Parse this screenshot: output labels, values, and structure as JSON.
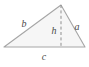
{
  "figure": {
    "kind": "geometry-diagram",
    "shape": "triangle",
    "background_color": "#ffffff",
    "fill_color": "#f6f6f6",
    "edge_color": "#a6a6a6",
    "dashed_color": "#8f8f8f",
    "label_color": "#4a4a4a",
    "width": 89,
    "height": 67
  },
  "geometry": {
    "vertices": {
      "left": {
        "x": 4,
        "y": 47
      },
      "apex": {
        "x": 61,
        "y": 5
      },
      "right": {
        "x": 85,
        "y": 47
      }
    },
    "altitude": {
      "from": {
        "x": 61,
        "y": 5
      },
      "to": {
        "x": 61,
        "y": 47
      },
      "style": "dashed"
    },
    "polygon_points": "4,47 61,5 85,47"
  },
  "labels": {
    "side_a": {
      "text": "a",
      "x": 77,
      "y": 30
    },
    "side_b": {
      "text": "b",
      "x": 24,
      "y": 27
    },
    "side_c": {
      "text": "c",
      "x": 44,
      "y": 60
    },
    "height_h": {
      "text": "h",
      "x": 54,
      "y": 34
    }
  },
  "chart_data": {
    "type": "diagram",
    "title": "",
    "elements": [
      {
        "name": "side-a",
        "label": "a",
        "role": "right-side"
      },
      {
        "name": "side-b",
        "label": "b",
        "role": "left-side"
      },
      {
        "name": "side-c",
        "label": "c",
        "role": "base"
      },
      {
        "name": "height-h",
        "label": "h",
        "role": "altitude"
      }
    ]
  }
}
